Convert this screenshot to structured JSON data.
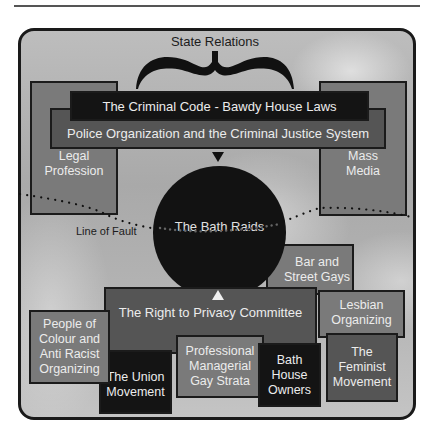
{
  "diagram": {
    "title": "State Relations",
    "state_institutions": {
      "criminal_code": "The Criminal Code - Bawdy House Laws",
      "police": "Police Organization and the Criminal Justice System"
    },
    "side_boxes": {
      "legal_profession": "Legal Profession",
      "mass_media": "Mass Media"
    },
    "center": "The Bath Raids",
    "line_label": "Line of Fault",
    "committee": "The Right to Privacy Committee",
    "groups": {
      "bar_street_gays": "Bar and Street Gays",
      "lesbian_organizing": "Lesbian Organizing",
      "feminist_movement": "The Feminist Movement",
      "people_of_colour": "People of Colour and Anti Racist Organizing",
      "union_movement": "The Union Movement",
      "professional_managerial": "Professional Managerial Gay Strata",
      "bath_house_owners": "Bath House Owners"
    },
    "colors": {
      "black_box": "#141414",
      "dark_box": "#555555",
      "mid_box": "#7a7a7a",
      "background": "#b4b4b4",
      "box_text": "#ececec"
    }
  }
}
